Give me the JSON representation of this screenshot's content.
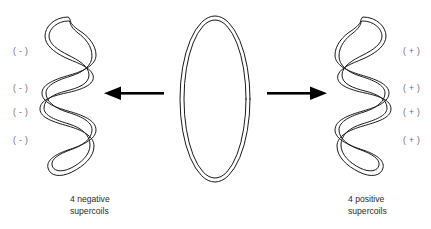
{
  "figure": {
    "background_color": "#ffffff",
    "stroke_color": "#1a1a1a",
    "label_color": "#6d6d6d",
    "caption_color": "#2b2b2b"
  },
  "center": {
    "shape_name": "relaxed-circular-dna",
    "description": "relaxed circular DNA double-line ellipse"
  },
  "left": {
    "shape_name": "negative-supercoiled-dna",
    "caption": "4 negative\nsupercoils",
    "sign_labels": [
      "( - )",
      "( - )",
      "( - )",
      "( - )"
    ],
    "crossings": 4,
    "sign": "-"
  },
  "right": {
    "shape_name": "positive-supercoiled-dna",
    "caption": "4 positive\nsupercoils",
    "sign_labels": [
      "( + )",
      "( + )",
      "( + )",
      "( + )"
    ],
    "crossings": 4,
    "sign": "+"
  },
  "arrows": {
    "left_arrow": {
      "name": "arrow-to-negative",
      "direction": "left",
      "color": "#000000"
    },
    "right_arrow": {
      "name": "arrow-to-positive",
      "direction": "right",
      "color": "#000000"
    }
  }
}
